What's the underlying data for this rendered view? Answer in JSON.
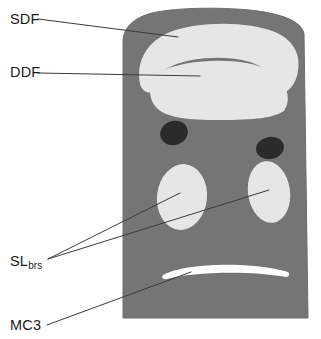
{
  "figure": {
    "type": "anatomical-cross-section",
    "background_color": "#ffffff",
    "block": {
      "name": "limb-cross-section-block",
      "fill_color": "#757575",
      "outline_color": "#6a6a6a"
    },
    "tissue_light_color": "#e6e6e6",
    "tissue_dark_color": "#2b2b2b",
    "tissue_white_color": "#ffffff",
    "leader_line_color": "#3a3a3a"
  },
  "labels": [
    {
      "id": "sdf",
      "text": "SDF",
      "subscript": "",
      "target": "superficial-digital-flexor-tendon"
    },
    {
      "id": "ddf",
      "text": "DDF",
      "subscript": "",
      "target": "deep-digital-flexor-tendon"
    },
    {
      "id": "slbrs",
      "text": "SL",
      "subscript": "brs",
      "target": "suspensory-ligament-branches"
    },
    {
      "id": "mc3",
      "text": "MC3",
      "subscript": "",
      "target": "third-metacarpal-bone"
    }
  ],
  "structures": [
    {
      "id": "sdf-region",
      "label": "SDF",
      "shade": "light"
    },
    {
      "id": "ddf-region",
      "label": "DDF",
      "shade": "light"
    },
    {
      "id": "dark-oval-left",
      "label": "",
      "shade": "dark"
    },
    {
      "id": "dark-oval-right",
      "label": "",
      "shade": "dark"
    },
    {
      "id": "sl-branch-left",
      "label": "SLbrs",
      "shade": "light"
    },
    {
      "id": "sl-branch-right",
      "label": "SLbrs",
      "shade": "light"
    },
    {
      "id": "mc3-region",
      "label": "MC3",
      "shade": "white"
    }
  ]
}
